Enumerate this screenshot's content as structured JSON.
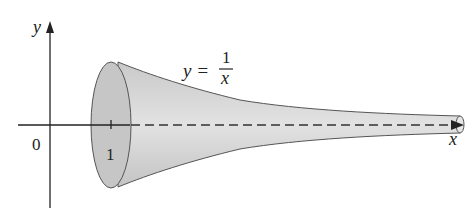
{
  "figure": {
    "axes": {
      "x_label": "x",
      "y_label": "y",
      "origin_label": "0",
      "tick_label": "1"
    },
    "equation": {
      "lhs": "y =",
      "numerator": "1",
      "denominator": "x"
    },
    "colors": {
      "surface_fill": "#d4d4d4",
      "face_fill": "#c4c4c4",
      "outline": "#555555",
      "axis": "#222222"
    }
  }
}
